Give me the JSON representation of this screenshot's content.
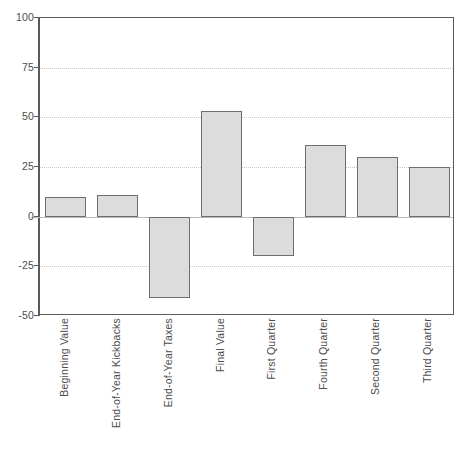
{
  "chart_data": {
    "type": "bar",
    "title": "",
    "xlabel": "",
    "ylabel": "",
    "categories": [
      "Beginning Value",
      "End-of-Year Kickbacks",
      "End-of-Year Taxes",
      "Final Value",
      "First Quarter",
      "Fourth Quarter",
      "Second Quarter",
      "Third Quarter"
    ],
    "values": [
      10,
      11,
      -41,
      53,
      -20,
      36,
      30,
      25
    ],
    "ylim": [
      -50,
      100
    ],
    "yticks": [
      100,
      75,
      50,
      25,
      0,
      -25,
      -50
    ],
    "ytick_labels": [
      "100",
      "75",
      "50",
      "25",
      "0",
      "-25",
      "-50"
    ],
    "grid": true,
    "grid_axis": "y",
    "legend": "none",
    "bar_color": "#dcdcdc",
    "bar_edge_color": "#6e6e6e",
    "axis_color": "#5a5a5a",
    "gridline_color": "#c9c9c9",
    "zero_line_color": "#b8b8b8"
  }
}
